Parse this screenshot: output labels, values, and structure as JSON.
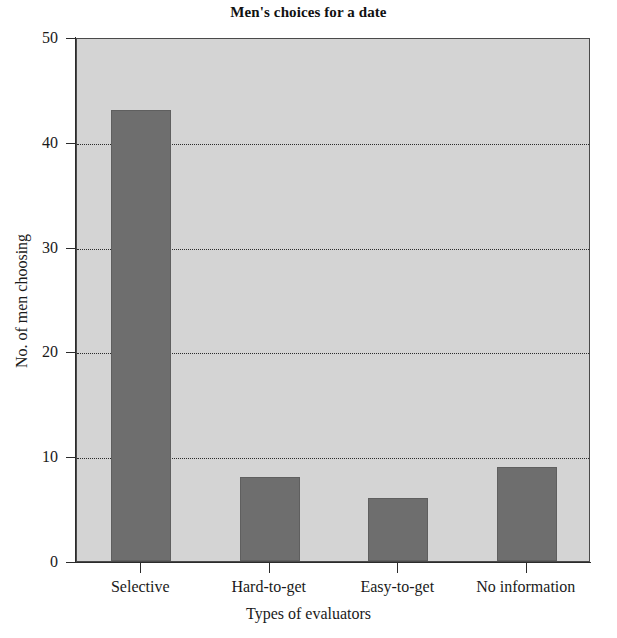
{
  "chart_data": {
    "type": "bar",
    "title": "Men's choices for a date",
    "xlabel": "Types of evaluators",
    "ylabel": "No. of men choosing",
    "categories": [
      "Selective",
      "Hard-to-get",
      "Easy-to-get",
      "No information"
    ],
    "values": [
      43,
      8,
      6,
      9
    ],
    "ylim": [
      0,
      50
    ],
    "yticks": [
      0,
      10,
      20,
      30,
      40,
      50
    ],
    "ytick_labels": [
      "0",
      "10",
      "20",
      "30",
      "40",
      "50"
    ],
    "gridlines": [
      10,
      20,
      30,
      40
    ],
    "grid": true,
    "legend": null,
    "colors": {
      "bar": "#6e6e6e",
      "plot_background": "#d4d4d4",
      "axis": "#2b2b2b",
      "text": "#1a1a1a",
      "figure_background": "#ffffff"
    }
  }
}
